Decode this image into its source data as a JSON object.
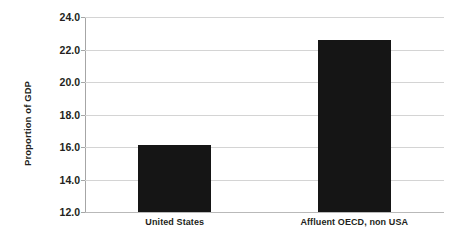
{
  "chart_data": {
    "type": "bar",
    "title": "",
    "subtitle": "",
    "xlabel": "",
    "ylabel": "Proportion of GDP",
    "categories": [
      "United States",
      "Affluent OECD, non USA"
    ],
    "values": [
      16.1,
      22.6
    ],
    "series": [
      {
        "name": "Proportion of GDP",
        "values": [
          16.1,
          22.6
        ]
      }
    ],
    "ylim": [
      12.0,
      24.0
    ],
    "yticks": [
      "12.0",
      "14.0",
      "16.0",
      "18.0",
      "20.0",
      "22.0",
      "24.0"
    ],
    "ytick_values": [
      12.0,
      14.0,
      16.0,
      18.0,
      20.0,
      22.0,
      24.0
    ],
    "grid": true,
    "grid_axis": "y",
    "legend": false,
    "legend_position": "none",
    "bar_color": "#151515",
    "grid_color": "#d4d4d4",
    "axis_color": "#a6a6a6",
    "text_color": "#231f20",
    "background_color": "#ffffff"
  }
}
